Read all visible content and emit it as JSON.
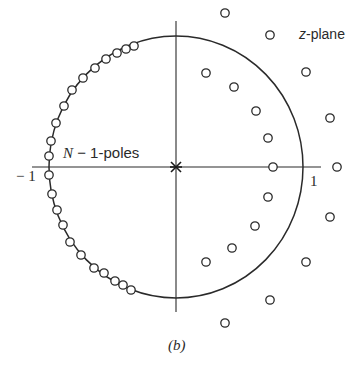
{
  "figure": {
    "caption": "(b)",
    "plane_label_var": "z",
    "plane_label_rest": "-plane",
    "poles_label_var": "N",
    "poles_label_rest": " − 1-poles",
    "tick_neg_one": "− 1",
    "tick_pos_one": "1",
    "origin_marker": "×"
  },
  "geometry": {
    "center": [
      176,
      167
    ],
    "radius_x": 127,
    "radius_y": 131,
    "x_axis": [
      32,
      321
    ],
    "y_axis": [
      21,
      312
    ],
    "pole_radius": 4.2
  },
  "poles": {
    "on_circle_left": [
      [
        134,
        46
      ],
      [
        126,
        49
      ],
      [
        117,
        53
      ],
      [
        106,
        59
      ],
      [
        95,
        68
      ],
      [
        83,
        78
      ],
      [
        72,
        90
      ],
      [
        64,
        106
      ],
      [
        56,
        123
      ],
      [
        51,
        141
      ],
      [
        49,
        156
      ],
      [
        49,
        175
      ],
      [
        52,
        194
      ],
      [
        57,
        210
      ],
      [
        63,
        225
      ],
      [
        70,
        242
      ],
      [
        81,
        255
      ],
      [
        94,
        268
      ],
      [
        104,
        273
      ],
      [
        115,
        281
      ],
      [
        123,
        285
      ],
      [
        131,
        290
      ]
    ],
    "inner_right": [
      [
        206,
        73
      ],
      [
        234,
        87
      ],
      [
        256,
        111
      ],
      [
        268,
        138
      ],
      [
        273,
        167
      ],
      [
        268,
        197
      ],
      [
        255,
        226
      ],
      [
        232,
        248
      ],
      [
        206,
        262
      ]
    ],
    "outer_right": [
      [
        225,
        13
      ],
      [
        270,
        35
      ],
      [
        306,
        72
      ],
      [
        330,
        118
      ],
      [
        337,
        167
      ],
      [
        330,
        217
      ],
      [
        306,
        262
      ],
      [
        270,
        300
      ],
      [
        225,
        323
      ]
    ]
  },
  "colors": {
    "ink": "#2a2a2a",
    "background": "#ffffff"
  }
}
